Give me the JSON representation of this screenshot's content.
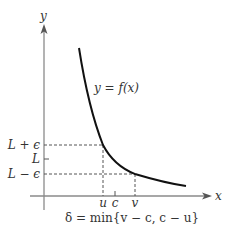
{
  "axes": {
    "x_label": "x",
    "y_label": "y",
    "axis_color": "#8a8a8a"
  },
  "curve": {
    "label": "y = f(x)",
    "color": "#111111"
  },
  "y_ticks": {
    "upper": "L + ϵ",
    "middle": "L",
    "lower": "L − ϵ"
  },
  "x_ticks": {
    "u": "u",
    "c": "c",
    "v": "v"
  },
  "formula": "δ = min{v − c, c − u}",
  "colors": {
    "dashed": "#555555",
    "text": "#333333"
  }
}
